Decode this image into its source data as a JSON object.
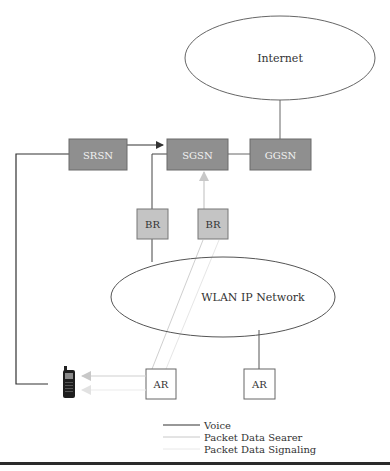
{
  "diagram": {
    "type": "network-architecture",
    "nodes": {
      "internet": {
        "label": "Internet"
      },
      "srsn": {
        "label": "SRSN"
      },
      "sgsn": {
        "label": "SGSN"
      },
      "ggsn": {
        "label": "GGSN"
      },
      "br_left": {
        "label": "BR"
      },
      "br_right": {
        "label": "BR"
      },
      "wlan": {
        "label": "WLAN IP Network"
      },
      "ar_left": {
        "label": "AR"
      },
      "ar_right": {
        "label": "AR"
      },
      "mobile": {
        "label": "mobile-phone"
      }
    },
    "edges": [
      {
        "from": "internet",
        "to": "ggsn",
        "style": "voice"
      },
      {
        "from": "srsn",
        "to": "sgsn",
        "style": "voice",
        "arrow": true
      },
      {
        "from": "sgsn",
        "to": "ggsn",
        "style": "voice"
      },
      {
        "from": "srsn",
        "to": "mobile",
        "style": "voice"
      },
      {
        "from": "br_left",
        "to": "sgsn",
        "style": "voice"
      },
      {
        "from": "br_left",
        "to": "wlan",
        "style": "voice"
      },
      {
        "from": "br_right",
        "to": "sgsn",
        "style": "bearer",
        "arrow": true
      },
      {
        "from": "br_right",
        "to": "ar_left",
        "style": "bearer"
      },
      {
        "from": "br_right",
        "to": "ar_left",
        "style": "signaling"
      },
      {
        "from": "wlan",
        "to": "ar_right",
        "style": "voice"
      },
      {
        "from": "ar_left",
        "to": "mobile",
        "style": "bearer",
        "arrow": true
      },
      {
        "from": "ar_left",
        "to": "mobile",
        "style": "signaling",
        "arrow": true
      }
    ]
  },
  "legend": {
    "items": [
      {
        "label": "Voice",
        "color": "#333333"
      },
      {
        "label": "Packet Data Searer",
        "color": "#c8c8c8"
      },
      {
        "label": "Packet Data Signaling",
        "color": "#e6e6e6"
      }
    ]
  },
  "colors": {
    "box_dark": "#8f8f8f",
    "box_light": "#c4c4c4",
    "outline": "#555555"
  }
}
